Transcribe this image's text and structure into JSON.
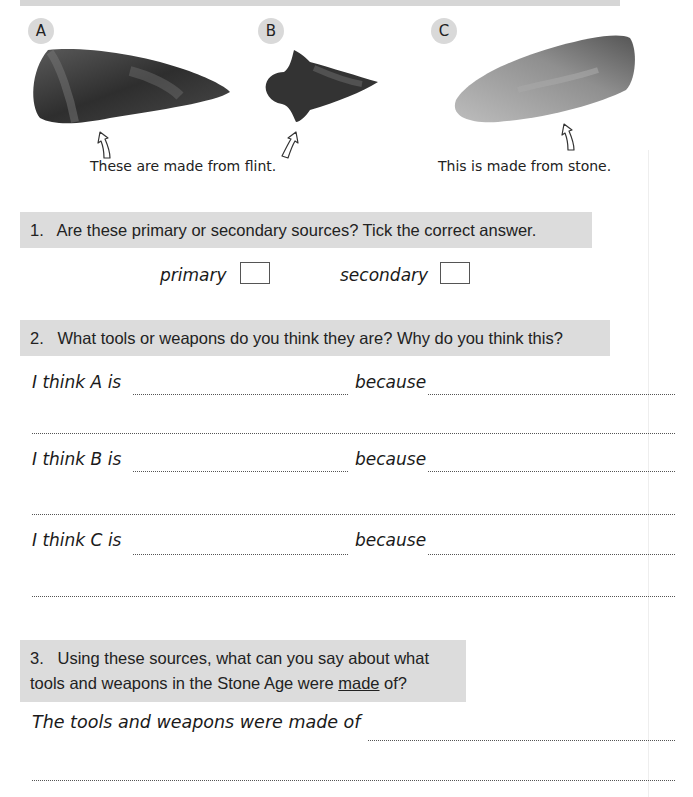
{
  "sources": [
    {
      "label": "A",
      "material_caption_group": "flint",
      "kind": "flint-blade"
    },
    {
      "label": "B",
      "material_caption_group": "flint",
      "kind": "flint-arrowhead"
    },
    {
      "label": "C",
      "material_caption_group": "stone",
      "kind": "stone-axe-head"
    }
  ],
  "captions": {
    "flint": "These are made from flint.",
    "stone": "This is made from stone."
  },
  "question1": {
    "number": "1.",
    "text": "Are these primary or secondary sources?  Tick the correct answer.",
    "options": [
      {
        "label": "primary",
        "checked": false
      },
      {
        "label": "secondary",
        "checked": false
      }
    ]
  },
  "question2": {
    "number": "2.",
    "text": "What tools or weapons do you think they are?  Why do you think this?",
    "rows": [
      {
        "prompt": "I think A is",
        "because": "because",
        "answer": "",
        "reason": ""
      },
      {
        "prompt": "I think B is",
        "because": "because",
        "answer": "",
        "reason": ""
      },
      {
        "prompt": "I think C is",
        "because": "because",
        "answer": "",
        "reason": ""
      }
    ]
  },
  "question3": {
    "number": "3.",
    "line1": "Using these sources, what can you say about what",
    "line2_before": "tools and weapons in the Stone Age were ",
    "line2_underlined": "made",
    "line2_after": " of?",
    "prompt": "The tools and weapons were made of",
    "answer": ""
  }
}
